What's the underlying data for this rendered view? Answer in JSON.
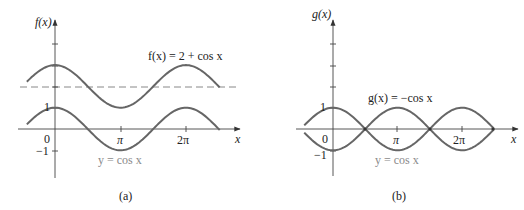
{
  "figure": {
    "panel_a": {
      "caption": "(a)",
      "y_axis_label": "f(x)",
      "x_axis_label": "x",
      "curve_label_top": "f(x) = 2 + cos x",
      "curve_label_bottom": "y = cos x",
      "tick_labels": {
        "y_one": "1",
        "y_neg_one": "−1",
        "origin": "0",
        "pi": "π",
        "two_pi": "2π"
      }
    },
    "panel_b": {
      "caption": "(b)",
      "y_axis_label": "g(x)",
      "x_axis_label": "x",
      "curve_label_top": "g(x) = −cos x",
      "curve_label_bottom": "y = cos x",
      "tick_labels": {
        "y_one": "1",
        "y_neg_one": "−1",
        "origin": "0",
        "pi": "π",
        "two_pi": "2π"
      }
    }
  },
  "chart_data": [
    {
      "type": "line",
      "title": "(a)",
      "xlabel": "x",
      "ylabel": "f(x)",
      "x_range": [
        -1.35,
        7.9
      ],
      "ylim": [
        -2,
        4
      ],
      "x_ticks": [
        "0",
        "π",
        "2π"
      ],
      "y_ticks": [
        "−1",
        "1"
      ],
      "series": [
        {
          "name": "f(x) = 2 + cos x",
          "expression": "2 + cos(x)",
          "x": [
            -1.35,
            0,
            1.5708,
            3.1416,
            4.7124,
            6.2832,
            7.9
          ],
          "values": [
            2.22,
            3,
            2,
            1,
            2,
            3,
            1.95
          ]
        },
        {
          "name": "y = cos x",
          "expression": "cos(x)",
          "x": [
            -1.35,
            0,
            1.5708,
            3.1416,
            4.7124,
            6.2832,
            7.9
          ],
          "values": [
            0.22,
            1,
            0,
            -1,
            0,
            1,
            -0.05
          ]
        },
        {
          "name": "y = 2 (dashed)",
          "expression": "2",
          "x": [
            -1.7,
            8.8
          ],
          "values": [
            2,
            2
          ]
        }
      ]
    },
    {
      "type": "line",
      "title": "(b)",
      "xlabel": "x",
      "ylabel": "g(x)",
      "x_range": [
        -1.4,
        7.85
      ],
      "ylim": [
        -2,
        4
      ],
      "x_ticks": [
        "0",
        "π",
        "2π"
      ],
      "y_ticks": [
        "−1",
        "1"
      ],
      "series": [
        {
          "name": "g(x) = −cos x",
          "expression": "-cos(x)",
          "x": [
            -1.4,
            0,
            1.5708,
            3.1416,
            4.7124,
            6.2832,
            7.85
          ],
          "values": [
            -0.17,
            -1,
            0,
            1,
            0,
            -1,
            0
          ]
        },
        {
          "name": "y = cos x",
          "expression": "cos(x)",
          "x": [
            -1.4,
            0,
            1.5708,
            3.1416,
            4.7124,
            6.2832,
            7.85
          ],
          "values": [
            0.17,
            1,
            0,
            -1,
            0,
            1,
            0
          ]
        }
      ]
    }
  ]
}
